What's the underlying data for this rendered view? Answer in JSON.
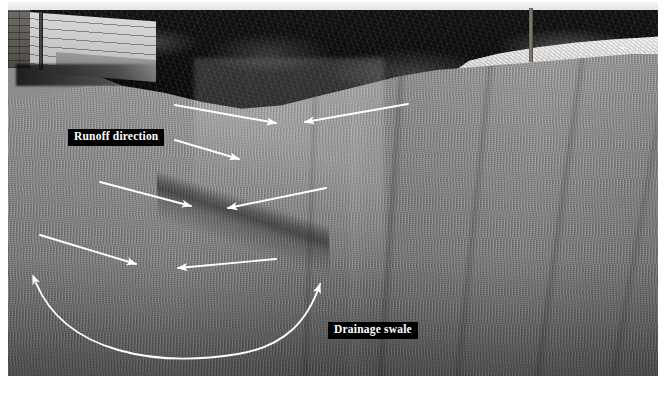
{
  "figure": {
    "kind": "annotated-photograph",
    "palette": {
      "label_background": "#000000",
      "label_text": "#ffffff",
      "arrow_stroke": "#ffffff",
      "lawn_mid": "#909090",
      "treeline_dark": "#0b0b0b",
      "gravel_light": "#eceae7",
      "siding_light": "#d8d8d6",
      "page_background": "#ffffff"
    }
  },
  "labels": {
    "runoff": "Runoff direction",
    "swale": "Drainage swale"
  },
  "annotations": {
    "arrows": [
      {
        "name": "runoff-arrow-1",
        "direction": "right-down",
        "from": [
          175,
          105
        ],
        "to": [
          278,
          123
        ]
      },
      {
        "name": "runoff-arrow-2",
        "direction": "left-down",
        "from": [
          408,
          104
        ],
        "to": [
          303,
          122
        ]
      },
      {
        "name": "runoff-arrow-3",
        "direction": "right-down",
        "from": [
          175,
          140
        ],
        "to": [
          241,
          159
        ]
      },
      {
        "name": "runoff-arrow-4",
        "direction": "right-down",
        "from": [
          100,
          182
        ],
        "to": [
          193,
          206
        ]
      },
      {
        "name": "runoff-arrow-5",
        "direction": "left-down",
        "from": [
          326,
          188
        ],
        "to": [
          226,
          208
        ]
      },
      {
        "name": "runoff-arrow-6",
        "direction": "right-down",
        "from": [
          40,
          235
        ],
        "to": [
          138,
          264
        ]
      },
      {
        "name": "runoff-arrow-7",
        "direction": "left-up",
        "from": [
          276,
          259
        ],
        "to": [
          176,
          268
        ]
      }
    ],
    "curve": {
      "name": "drainage-swale-curve",
      "style": "double-headed-arc",
      "left_tip": [
        32,
        281
      ],
      "bottom": [
        178,
        349
      ],
      "right_tip": [
        318,
        279
      ]
    }
  },
  "scene": {
    "house": "siding-wall-with-brick-corner-and-downspout",
    "pole": "vertical-post",
    "gravel": "light-rock-bed",
    "treeline": "dark-shrub-mass",
    "lawn": "mown-turf-with-stripes",
    "swale": "shallow-diagonal-drainage-channel"
  }
}
